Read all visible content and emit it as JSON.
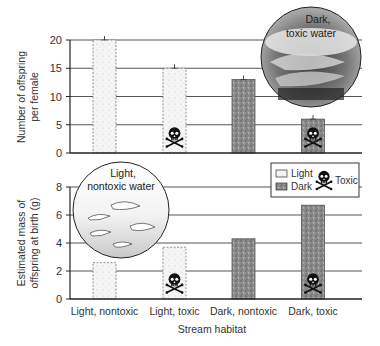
{
  "chart_data": [
    {
      "type": "bar",
      "panel": "top",
      "categories": [
        "Light, nontoxic",
        "Light, toxic",
        "Dark, nontoxic",
        "Dark, toxic"
      ],
      "values": [
        20,
        15,
        13,
        6
      ],
      "fill": [
        "light",
        "light",
        "dark",
        "dark"
      ],
      "toxic": [
        false,
        true,
        false,
        true
      ],
      "error_bars": true,
      "ylabel": "Number of offspring per female",
      "ylim": [
        0,
        20
      ],
      "yticks": [
        0,
        5,
        10,
        15,
        20
      ],
      "grid": true,
      "inset": {
        "label_line1": "Dark,",
        "label_line2": "toxic water",
        "placement": "top-right",
        "tone": "dark"
      }
    },
    {
      "type": "bar",
      "panel": "bottom",
      "categories": [
        "Light, nontoxic",
        "Light, toxic",
        "Dark, nontoxic",
        "Dark, toxic"
      ],
      "values": [
        2.6,
        3.7,
        4.3,
        6.7
      ],
      "fill": [
        "light",
        "light",
        "dark",
        "dark"
      ],
      "toxic": [
        false,
        true,
        false,
        true
      ],
      "xlabel": "Stream habitat",
      "ylabel": "Estimated mass of offspring at birth (g)",
      "ylabel_line1": "Estimated mass of",
      "ylabel_line2": "offspring at birth (g)",
      "ylim": [
        0,
        8
      ],
      "yticks": [
        0,
        2,
        4,
        6,
        8
      ],
      "grid": true,
      "inset": {
        "label_line1": "Light,",
        "label_line2": "nontoxic water",
        "placement": "top-left",
        "tone": "light"
      },
      "legend": {
        "placement": "top-right",
        "entries": [
          {
            "label": "Light",
            "swatch": "light"
          },
          {
            "label": "Dark",
            "swatch": "dark"
          },
          {
            "label": "Toxic",
            "swatch": "skull-crossbones-icon"
          }
        ]
      }
    }
  ],
  "labels": {
    "top_ylabel_line1": "Number of offspring",
    "top_ylabel_line2": "per female"
  },
  "colors": {
    "light_fill": "#f4f4f4",
    "dark_fill": "#8a8a8a",
    "grid": "#444444",
    "axis": "#222222"
  }
}
